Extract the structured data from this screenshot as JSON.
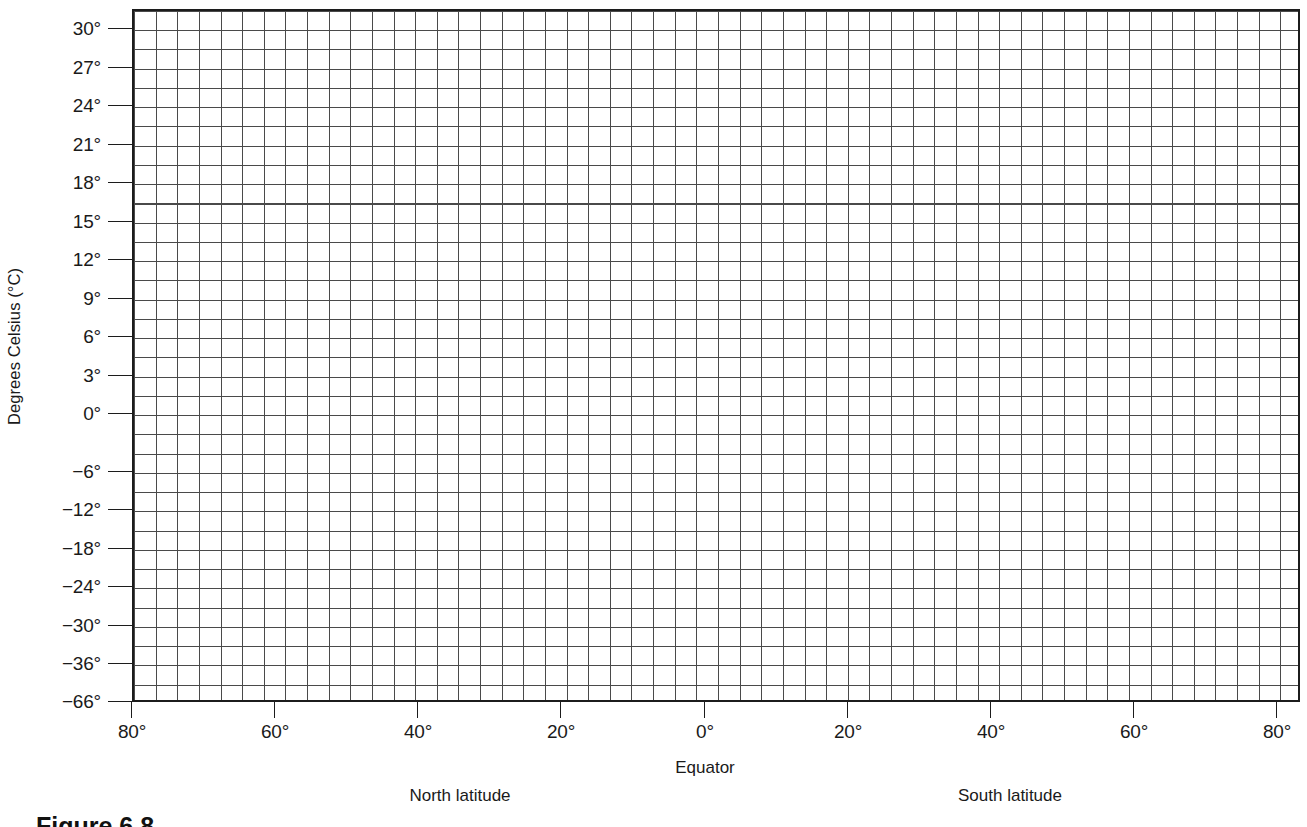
{
  "figure": {
    "caption": "Figure 6.8"
  },
  "chart_data": {
    "type": "line",
    "title": "",
    "subtitle": "",
    "xlabel": "Equator",
    "ylabel": "Degrees Celsius (°C)",
    "grid": true,
    "legend": null,
    "annotations": [
      "North latitude",
      "South latitude"
    ],
    "series": [],
    "x_axis": {
      "label": "Equator",
      "left_region_label": "North latitude",
      "right_region_label": "South latitude",
      "tick_labels": [
        "80°",
        "60°",
        "40°",
        "20°",
        "0°",
        "20°",
        "40°",
        "60°",
        "80°"
      ],
      "tick_values": [
        80,
        60,
        40,
        20,
        0,
        -20,
        -40,
        -60,
        -80
      ],
      "tick_positions_px": [
        132,
        275,
        418,
        561,
        705,
        848,
        991,
        1134,
        1277
      ],
      "xlim": [
        80,
        -80
      ],
      "minor_divisions_per_major": 6.6
    },
    "y_axis": {
      "label": "Degrees Celsius (°C)",
      "tick_labels": [
        "30°",
        "27°",
        "24°",
        "21°",
        "18°",
        "15°",
        "12°",
        "9°",
        "6°",
        "3°",
        "0°",
        "−6°",
        "−12°",
        "−18°",
        "−24°",
        "−30°",
        "−36°",
        "−66°"
      ],
      "tick_values": [
        30,
        27,
        24,
        21,
        18,
        15,
        12,
        9,
        6,
        3,
        0,
        -6,
        -12,
        -18,
        -24,
        -30,
        -36,
        -66
      ],
      "tick_positions_px": [
        29,
        68,
        106,
        145,
        183,
        222,
        260,
        299,
        337,
        376,
        414,
        472,
        510,
        549,
        587,
        626,
        664,
        702
      ],
      "ylim": [
        30,
        -66
      ]
    },
    "values": [],
    "categories": []
  },
  "colors": {
    "grid_line": "#4a4a4a",
    "axis_line": "#1c1c1c",
    "text": "#1a1a1a",
    "background": "#ffffff"
  }
}
